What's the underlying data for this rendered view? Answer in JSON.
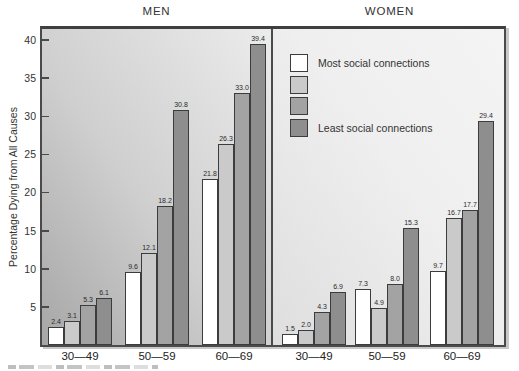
{
  "chart_data": {
    "type": "bar",
    "title": "",
    "ylabel": "Percentage Dying from All Causes",
    "xlabel": "",
    "ylim": [
      0,
      41.4
    ],
    "yticks": [
      5,
      10,
      15,
      20,
      25,
      30,
      35,
      40
    ],
    "grid": false,
    "legend_position": "top of right (WOMEN) panel",
    "series_names": [
      "Most social connections",
      "",
      "",
      "Least social connections"
    ],
    "series_colors": [
      "#ffffff",
      "#cacaca",
      "#a3a3a3",
      "#8e8e8e"
    ],
    "panels": [
      {
        "title": "MEN",
        "categories": [
          "30—49",
          "50—59",
          "60—69"
        ],
        "groups": [
          [
            "2.4",
            "3.1",
            "5.3",
            "6.1"
          ],
          [
            "9.6",
            "12.1",
            "18.2",
            "30.8"
          ],
          [
            "21.8",
            "26.3",
            "33.0",
            "39.4"
          ]
        ]
      },
      {
        "title": "WOMEN",
        "categories": [
          "30—49",
          "50—59",
          "60—69"
        ],
        "groups": [
          [
            "1.5",
            "2.0",
            "4.3",
            "6.9"
          ],
          [
            "7.3",
            "4.9",
            "8.0",
            "15.3"
          ],
          [
            "9.7",
            "16.7",
            "17.7",
            "29.4"
          ]
        ]
      }
    ]
  },
  "legend": {
    "items": [
      {
        "label": "Most social connections",
        "color": "#ffffff"
      },
      {
        "label": "",
        "color": "#cacaca"
      },
      {
        "label": "",
        "color": "#a3a3a3"
      },
      {
        "label": "Least social connections",
        "color": "#8e8e8e"
      }
    ]
  }
}
